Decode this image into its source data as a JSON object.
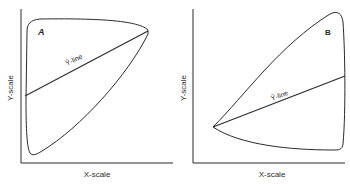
{
  "panels": [
    {
      "id": "A",
      "label": "A",
      "x_axis_label": "X-scale",
      "y_axis_label": "Y-scale",
      "line_label": "Ŷ-line",
      "description": "Envelope widest at low X; regression line slopes upward from left-middle to top-right apex"
    },
    {
      "id": "B",
      "label": "B",
      "x_axis_label": "X-scale",
      "y_axis_label": "Y-scale",
      "line_label": "Ŷ-line",
      "description": "Envelope widest at high X; regression line slopes upward from left apex to right-middle"
    }
  ],
  "colors": {
    "ink": "#2a2a2a",
    "background": "#ffffff"
  }
}
